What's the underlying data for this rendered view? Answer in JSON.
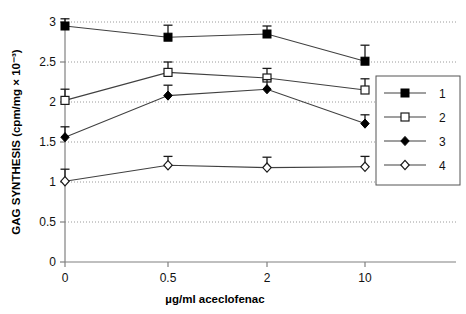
{
  "chart_data": {
    "type": "line",
    "title": "",
    "xlabel": "µg/ml aceclofenac",
    "ylabel": "GAG SYNTHESIS (cpm/mg × 10⁻³)",
    "categories": [
      "0",
      "0.5",
      "2",
      "10"
    ],
    "xtick_labels": [
      "0",
      "0.5",
      "2",
      "10"
    ],
    "ytick_labels": [
      "0",
      "0.5",
      "1",
      "1.5",
      "2",
      "2.5",
      "3"
    ],
    "ylim": [
      0,
      3
    ],
    "ytick_values": [
      0,
      0.5,
      1,
      1.5,
      2,
      2.5,
      3
    ],
    "grid": "horizontal-dotted",
    "legend_position": "right",
    "series": [
      {
        "name": "1",
        "marker": "filled-square",
        "values": [
          2.95,
          2.81,
          2.85,
          2.51
        ],
        "errors": [
          0.09,
          0.15,
          0.1,
          0.2
        ]
      },
      {
        "name": "2",
        "marker": "open-square",
        "values": [
          2.02,
          2.37,
          2.3,
          2.15
        ],
        "errors": [
          0.14,
          0.13,
          0.12,
          0.14
        ]
      },
      {
        "name": "3",
        "marker": "filled-diamond",
        "values": [
          1.56,
          2.08,
          2.16,
          1.73
        ],
        "errors": [
          0.13,
          0.13,
          0.12,
          0.11
        ]
      },
      {
        "name": "4",
        "marker": "open-diamond",
        "values": [
          1.01,
          1.21,
          1.18,
          1.19
        ],
        "errors": [
          0.15,
          0.11,
          0.13,
          0.13
        ]
      }
    ]
  },
  "legend": {
    "entries": [
      {
        "label": "1",
        "marker": "filled-square"
      },
      {
        "label": "2",
        "marker": "open-square"
      },
      {
        "label": "3",
        "marker": "filled-diamond"
      },
      {
        "label": "4",
        "marker": "open-diamond"
      }
    ]
  },
  "colors": {
    "line": "#404040",
    "axis": "#808080",
    "grid": "#9a9a9a",
    "marker_fill": "#000000",
    "marker_open": "#ffffff",
    "text": "#111111"
  }
}
